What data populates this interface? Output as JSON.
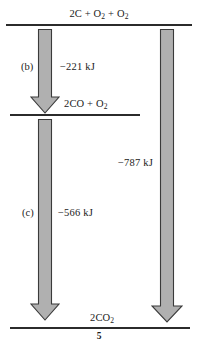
{
  "diagram": {
    "type": "enthalpy-level-diagram",
    "title_text": "",
    "page_number": "5",
    "colors": {
      "line": "#2b2b2b",
      "arrow_fill": "#b0b0b0",
      "arrow_stroke": "#3a3a3a",
      "text": "#1a1a1a",
      "background": "#ffffff"
    },
    "levels": [
      {
        "id": "reactants",
        "label_html": "2C + O<sub>2</sub> + O<sub>2</sub>",
        "label_text": "2C + O2 + O2"
      },
      {
        "id": "intermediate",
        "label_html": "2CO + O<sub>2</sub>",
        "label_text": "2CO + O2"
      },
      {
        "id": "products",
        "label_html": "2CO<sub>2</sub>",
        "label_text": "2CO2"
      }
    ],
    "steps": [
      {
        "id": "b",
        "step_label": "(b)",
        "delta_label": "−221 kJ",
        "value": -221,
        "unit": "kJ",
        "from": "reactants",
        "to": "intermediate"
      },
      {
        "id": "c",
        "step_label": "(c)",
        "delta_label": "−566 kJ",
        "value": -566,
        "unit": "kJ",
        "from": "intermediate",
        "to": "products"
      },
      {
        "id": "total",
        "step_label": "",
        "delta_label": "−787 kJ",
        "value": -787,
        "unit": "kJ",
        "from": "reactants",
        "to": "products"
      }
    ]
  },
  "chart_data": {
    "type": "bar",
    "title": "",
    "xlabel": "",
    "ylabel": "Enthalpy",
    "categories": [
      "2C + O2 + O2",
      "2CO + O2",
      "2CO2"
    ],
    "values": [
      0,
      -221,
      -787
    ],
    "annotations": [
      "(b) −221 kJ",
      "(c) −566 kJ",
      "−787 kJ"
    ],
    "grid": false,
    "legend": "none"
  }
}
